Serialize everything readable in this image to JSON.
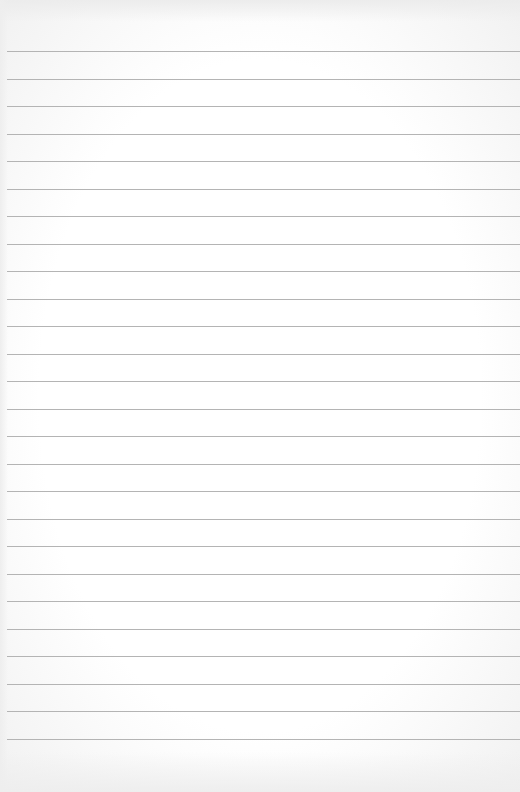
{
  "paper": {
    "type": "blank lined paper",
    "line_count": 26,
    "first_line_y": 51,
    "line_spacing": 27.52,
    "line_color": "#b4b4b4",
    "background_color": "#ffffff"
  }
}
